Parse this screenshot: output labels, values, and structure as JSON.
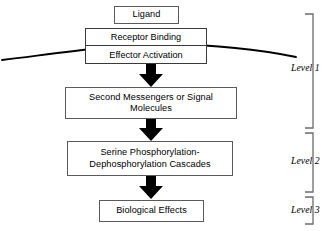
{
  "diagram": {
    "colors": {
      "box_border": "#5a5a5a",
      "receptor_border": "#3a3a3a",
      "arrow_fill": "#000000",
      "membrane_stroke": "#000000",
      "bracket_stroke": "#6b6b6b",
      "text": "#000000",
      "background": "#ffffff"
    },
    "nodes": [
      {
        "id": "ligand",
        "label": "Ligand"
      },
      {
        "id": "receptor_binding",
        "label": "Receptor Binding"
      },
      {
        "id": "effector_activation",
        "label": "Effector Activation"
      },
      {
        "id": "second_messengers",
        "label": "Second Messengers or Signal\nMolecules"
      },
      {
        "id": "serine_cascades",
        "label": "Serine Phosphorylation-\nDephosphorylation Cascades"
      },
      {
        "id": "biological_effects",
        "label": "Biological Effects"
      }
    ],
    "arrows": [
      {
        "id": "arrow-1",
        "from": "effector_activation",
        "to": "second_messengers",
        "style": "block-down"
      },
      {
        "id": "arrow-2",
        "from": "second_messengers",
        "to": "serine_cascades",
        "style": "block-down"
      },
      {
        "id": "arrow-3",
        "from": "serine_cascades",
        "to": "biological_effects",
        "style": "block-down"
      }
    ],
    "membrane": {
      "id": "plasma-membrane",
      "shape": "shallow-arc",
      "description": "Curved line representing the plasma membrane crossing the receptor complex"
    },
    "levels": [
      {
        "id": "level_1",
        "label": "Level 1"
      },
      {
        "id": "level_2",
        "label": "Level 2"
      },
      {
        "id": "level_3",
        "label": "Level 3"
      }
    ]
  }
}
